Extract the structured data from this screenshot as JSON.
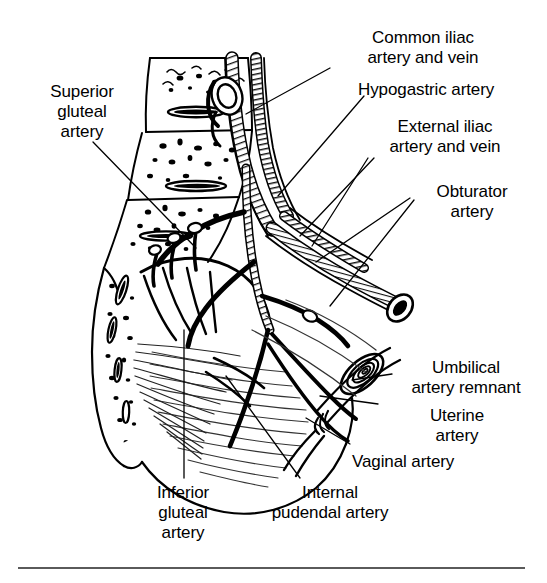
{
  "figure": {
    "background_color": "#ffffff",
    "ink_color": "#000000",
    "rule_color": "#5a5a5a",
    "style": "line-engraving / pen-and-ink medical illustration"
  },
  "labels": {
    "superior_gluteal": "Superior\ngluteal\nartery",
    "common_iliac": "Common iliac\nartery and vein",
    "hypogastric": "Hypogastric artery",
    "external_iliac": "External iliac\nartery and vein",
    "obturator": "Obturator\nartery",
    "umbilical_remnant": "Umbilical\nartery remnant",
    "uterine": "Uterine\nartery",
    "vaginal": "Vaginal artery",
    "internal_pudendal": "Internal\npudendal artery",
    "inferior_gluteal": "Inferior\ngluteal\nartery"
  },
  "label_list": [
    {
      "id": "superior-gluteal-artery",
      "text": "Superior gluteal artery",
      "align": "center",
      "x": 28,
      "y": 82
    },
    {
      "id": "common-iliac",
      "text": "Common iliac artery and vein",
      "align": "center",
      "x": 332,
      "y": 28
    },
    {
      "id": "hypogastric-artery",
      "text": "Hypogastric artery",
      "align": "left",
      "x": 358,
      "y": 80
    },
    {
      "id": "external-iliac",
      "text": "External iliac artery and vein",
      "align": "center",
      "x": 356,
      "y": 117
    },
    {
      "id": "obturator-artery",
      "text": "Obturator artery",
      "align": "center",
      "x": 412,
      "y": 180
    },
    {
      "id": "umbilical-artery-remnant",
      "text": "Umbilical artery remnant",
      "align": "center",
      "x": 398,
      "y": 358
    },
    {
      "id": "uterine-artery",
      "text": "Uterine artery",
      "align": "center",
      "x": 400,
      "y": 405
    },
    {
      "id": "vaginal-artery",
      "text": "Vaginal artery",
      "align": "left",
      "x": 352,
      "y": 451
    },
    {
      "id": "internal-pudendal-artery",
      "text": "Internal pudendal artery",
      "align": "center",
      "x": 264,
      "y": 483
    },
    {
      "id": "inferior-gluteal-artery",
      "text": "Inferior gluteal artery",
      "align": "center",
      "x": 141,
      "y": 483
    }
  ],
  "structures": [
    "sacral vertebrae with cancellous bone stipple",
    "sacral foramina",
    "ilium / iliac bone margin",
    "common iliac artery and vein descending",
    "hypogastric (internal iliac) artery",
    "external iliac artery and vein",
    "superior gluteal artery",
    "inferior gluteal artery",
    "obturator artery",
    "umbilical artery remnant (obliterated)",
    "uterine artery",
    "vaginal artery",
    "internal pudendal artery",
    "piriformis and coccygeus muscle fibers",
    "levator ani / pelvic floor striations",
    "sacrospinous and sacrotuberous ligaments"
  ]
}
